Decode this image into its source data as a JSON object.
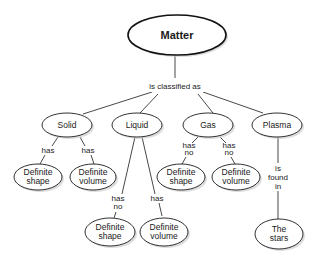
{
  "diagram": {
    "type": "concept-map",
    "root": {
      "label": "Matter"
    },
    "root_link": "is classified as",
    "categories": [
      {
        "label": "Solid",
        "links": [
          {
            "label_line1": "has",
            "label_line2": "",
            "target": {
              "line1": "Definite",
              "line2": "shape"
            }
          },
          {
            "label_line1": "has",
            "label_line2": "",
            "target": {
              "line1": "Definite",
              "line2": "volume"
            }
          }
        ]
      },
      {
        "label": "Liquid",
        "links": [
          {
            "label_line1": "has",
            "label_line2": "no",
            "target": {
              "line1": "Definite",
              "line2": "shape"
            }
          },
          {
            "label_line1": "has",
            "label_line2": "",
            "target": {
              "line1": "Definite",
              "line2": "volume"
            }
          }
        ]
      },
      {
        "label": "Gas",
        "links": [
          {
            "label_line1": "has",
            "label_line2": "no",
            "target": {
              "line1": "Definite",
              "line2": "shape"
            }
          },
          {
            "label_line1": "has",
            "label_line2": "no",
            "target": {
              "line1": "Definite",
              "line2": "volume"
            }
          }
        ]
      },
      {
        "label": "Plasma",
        "links": [
          {
            "label_line1": "is",
            "label_line2": "found",
            "label_line3": "in",
            "target": {
              "line1": "The",
              "line2": "stars"
            }
          }
        ]
      }
    ]
  }
}
